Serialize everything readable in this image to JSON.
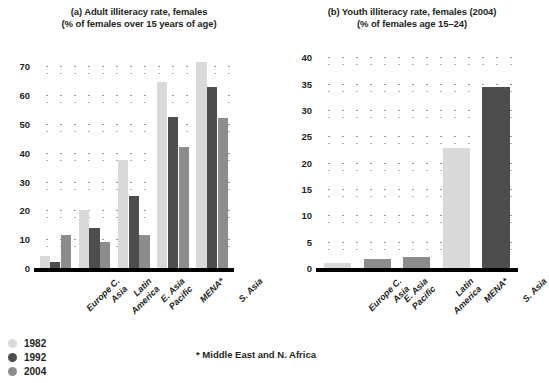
{
  "colors": {
    "series_1982": "#d9d9d9",
    "series_1992": "#4d4d4d",
    "series_2004": "#8c8c8c",
    "axis": "#000000",
    "text": "#231f20",
    "grid_dot": "#9a9a9a"
  },
  "legend": {
    "items": [
      {
        "label": "1982",
        "color": "#d9d9d9"
      },
      {
        "label": "1992",
        "color": "#4d4d4d"
      },
      {
        "label": "2004",
        "color": "#8c8c8c"
      }
    ]
  },
  "footnote": "* Middle East and N. Africa",
  "chart_data": [
    {
      "type": "bar",
      "id": "panel-a",
      "title": "(a) Adult illiteracy rate, females",
      "subtitle": "(% of females over 15 years of age)",
      "xlabel": "",
      "ylabel": "",
      "ylim": [
        0,
        75
      ],
      "yticks": [
        0,
        10,
        20,
        30,
        40,
        50,
        60,
        70
      ],
      "ytick_labels": [
        "0",
        "10",
        "20",
        "30",
        "40",
        "50",
        "60",
        "70"
      ],
      "grid": true,
      "legend_position": "bottom-left",
      "categories": [
        "Europe C. Asia",
        "Latin America",
        "E. Asia Pacific",
        "MENA*",
        "S. Asia"
      ],
      "category_lines": [
        [
          "Europe C.",
          "Asia"
        ],
        [
          "Latin",
          "America"
        ],
        [
          "E. Asia",
          "Pacific"
        ],
        [
          "MENA*"
        ],
        [
          "S. Asia"
        ]
      ],
      "series": [
        {
          "name": "1982",
          "color": "#d9d9d9",
          "values": [
            4.0,
            20.0,
            37.5,
            64.5,
            71.5
          ]
        },
        {
          "name": "1992",
          "color": "#4d4d4d",
          "values": [
            2.0,
            14.0,
            25.0,
            52.5,
            63.0
          ]
        },
        {
          "name": "2004",
          "color": "#8c8c8c",
          "values": [
            11.5,
            9.0,
            11.5,
            42.0,
            52.0
          ]
        }
      ]
    },
    {
      "type": "bar",
      "id": "panel-b",
      "title": "(b) Youth illiteracy rate, females (2004)",
      "subtitle": "(% of females age 15–24)",
      "xlabel": "",
      "ylabel": "",
      "ylim": [
        0,
        41
      ],
      "yticks": [
        0,
        5,
        10,
        15,
        20,
        25,
        30,
        35,
        40
      ],
      "ytick_labels": [
        "0",
        "5",
        "10",
        "15",
        "20",
        "25",
        "30",
        "35",
        "40"
      ],
      "grid": true,
      "legend_position": "none",
      "categories": [
        "Europe C. Asia",
        "E. Asia Pacific",
        "Latin America",
        "MENA*",
        "S. Asia"
      ],
      "category_lines": [
        [
          "Europe C.",
          "Asia"
        ],
        [
          "E. Asia",
          "Pacific"
        ],
        [
          "Latin",
          "America"
        ],
        [
          "MENA*"
        ],
        [
          "S. Asia"
        ]
      ],
      "series": [
        {
          "name": "2004",
          "values": [
            1.0,
            1.8,
            2.0,
            22.8,
            34.3
          ],
          "colors": [
            "#d9d9d9",
            "#8c8c8c",
            "#8c8c8c",
            "#d9d9d9",
            "#4d4d4d"
          ]
        }
      ]
    }
  ]
}
